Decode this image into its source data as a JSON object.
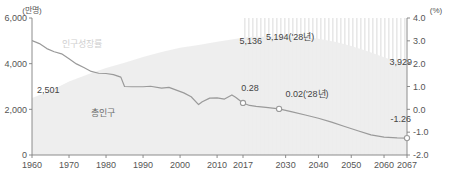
{
  "chart_data": {
    "type": "area",
    "title": "",
    "subtitle": "",
    "xlabel": "",
    "ylabel": "",
    "left_axis": {
      "unit_label": "(만명)",
      "ticks": [
        "6,000",
        "4,000",
        "2,000",
        "0"
      ],
      "tick_values": [
        6000,
        4000,
        2000,
        0
      ],
      "ylim": [
        0,
        6000
      ]
    },
    "right_axis": {
      "unit_label": "(%)",
      "ticks": [
        "4.0",
        "3.0",
        "2.0",
        "1.0",
        "0.0",
        "-1.0",
        "-2.0"
      ],
      "tick_values": [
        4.0,
        3.0,
        2.0,
        1.0,
        0.0,
        -1.0,
        -2.0
      ],
      "ylim": [
        -2.0,
        4.0
      ]
    },
    "x": {
      "tick_labels": [
        "1960",
        "1970",
        "1980",
        "1990",
        "2000",
        "2010",
        "2017",
        "2030",
        "2040",
        "2050",
        "2060",
        "2067"
      ],
      "tick_values": [
        1960,
        1970,
        1980,
        1990,
        2000,
        2010,
        2017,
        2030,
        2040,
        2050,
        2060,
        2067
      ],
      "xlim": [
        1960,
        2067
      ]
    },
    "forecast_region": {
      "label": "",
      "start": 2017,
      "end": 2067,
      "hatched": true
    },
    "grid": false,
    "legend_position": "inline",
    "series": [
      {
        "name": "총인구",
        "type": "area",
        "axis": "left",
        "color": "#ededed",
        "points": [
          {
            "x": 1960,
            "y": 2501
          },
          {
            "x": 1965,
            "y": 2819
          },
          {
            "x": 1970,
            "y": 3224
          },
          {
            "x": 1975,
            "y": 3528
          },
          {
            "x": 1980,
            "y": 3812
          },
          {
            "x": 1985,
            "y": 4042
          },
          {
            "x": 1990,
            "y": 4287
          },
          {
            "x": 1995,
            "y": 4509
          },
          {
            "x": 2000,
            "y": 4701
          },
          {
            "x": 2005,
            "y": 4818
          },
          {
            "x": 2010,
            "y": 4955
          },
          {
            "x": 2017,
            "y": 5136
          },
          {
            "x": 2020,
            "y": 5178
          },
          {
            "x": 2028,
            "y": 5194
          },
          {
            "x": 2030,
            "y": 5193
          },
          {
            "x": 2035,
            "y": 5163
          },
          {
            "x": 2040,
            "y": 5086
          },
          {
            "x": 2045,
            "y": 4957
          },
          {
            "x": 2050,
            "y": 4774
          },
          {
            "x": 2055,
            "y": 4544
          },
          {
            "x": 2060,
            "y": 4284
          },
          {
            "x": 2067,
            "y": 3929
          }
        ]
      },
      {
        "name": "인구성장률",
        "type": "line",
        "axis": "right",
        "color": "#9a9a9a",
        "points": [
          {
            "x": 1960,
            "y": 3.01
          },
          {
            "x": 1962,
            "y": 2.88
          },
          {
            "x": 1964,
            "y": 2.66
          },
          {
            "x": 1966,
            "y": 2.52
          },
          {
            "x": 1968,
            "y": 2.43
          },
          {
            "x": 1970,
            "y": 2.21
          },
          {
            "x": 1972,
            "y": 1.99
          },
          {
            "x": 1974,
            "y": 1.83
          },
          {
            "x": 1976,
            "y": 1.66
          },
          {
            "x": 1978,
            "y": 1.58
          },
          {
            "x": 1980,
            "y": 1.57
          },
          {
            "x": 1982,
            "y": 1.52
          },
          {
            "x": 1984,
            "y": 1.41
          },
          {
            "x": 1985,
            "y": 1.0
          },
          {
            "x": 1987,
            "y": 0.99
          },
          {
            "x": 1990,
            "y": 0.99
          },
          {
            "x": 1992,
            "y": 1.01
          },
          {
            "x": 1995,
            "y": 0.93
          },
          {
            "x": 1997,
            "y": 0.96
          },
          {
            "x": 1999,
            "y": 0.84
          },
          {
            "x": 2001,
            "y": 0.72
          },
          {
            "x": 2003,
            "y": 0.55
          },
          {
            "x": 2005,
            "y": 0.21
          },
          {
            "x": 2006,
            "y": 0.33
          },
          {
            "x": 2008,
            "y": 0.49
          },
          {
            "x": 2010,
            "y": 0.5
          },
          {
            "x": 2012,
            "y": 0.45
          },
          {
            "x": 2014,
            "y": 0.63
          },
          {
            "x": 2015,
            "y": 0.53
          },
          {
            "x": 2017,
            "y": 0.28
          },
          {
            "x": 2019,
            "y": 0.17
          },
          {
            "x": 2021,
            "y": 0.13
          },
          {
            "x": 2024,
            "y": 0.09
          },
          {
            "x": 2028,
            "y": 0.02
          },
          {
            "x": 2032,
            "y": -0.11
          },
          {
            "x": 2036,
            "y": -0.25
          },
          {
            "x": 2040,
            "y": -0.39
          },
          {
            "x": 2044,
            "y": -0.56
          },
          {
            "x": 2048,
            "y": -0.75
          },
          {
            "x": 2052,
            "y": -0.94
          },
          {
            "x": 2056,
            "y": -1.12
          },
          {
            "x": 2060,
            "y": -1.22
          },
          {
            "x": 2064,
            "y": -1.25
          },
          {
            "x": 2067,
            "y": -1.26
          }
        ]
      }
    ],
    "annotations": [
      {
        "id": "pop-start",
        "text": "2,501",
        "x": 1960,
        "value": 2501,
        "axis": "left"
      },
      {
        "id": "pop-2017",
        "text": "5,136",
        "x": 2017,
        "value": 5136,
        "axis": "left"
      },
      {
        "id": "pop-peak",
        "text": "5,194('28년)",
        "x": 2028,
        "value": 5194,
        "axis": "left"
      },
      {
        "id": "pop-end",
        "text": "3,929",
        "x": 2067,
        "value": 3929,
        "axis": "left"
      },
      {
        "id": "rate-2017",
        "text": "0.28",
        "x": 2017,
        "value": 0.28,
        "axis": "right",
        "marker": true
      },
      {
        "id": "rate-2028",
        "text": "0.02('28년)",
        "x": 2028,
        "value": 0.02,
        "axis": "right",
        "marker": true
      },
      {
        "id": "rate-2067",
        "text": "-1.26",
        "x": 2067,
        "value": -1.26,
        "axis": "right",
        "marker": true
      }
    ],
    "series_labels": [
      {
        "id": "label-growth-rate",
        "text": "인구성장률"
      },
      {
        "id": "label-total-population",
        "text": "총인구"
      }
    ]
  },
  "colors": {
    "area_fill": "#ededed",
    "line": "#9a9a9a",
    "axis": "#808080",
    "text": "#4a4a4a",
    "hatch": "#e2e2e2"
  }
}
